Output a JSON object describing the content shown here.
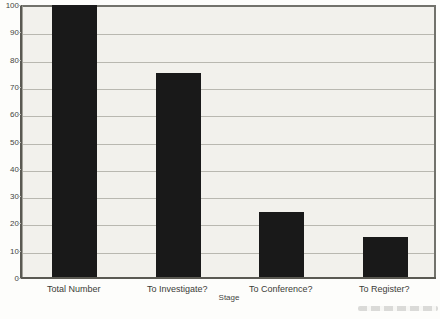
{
  "chart_data": {
    "type": "bar",
    "title": "",
    "xlabel": "Stage",
    "ylabel": "",
    "categories": [
      "Total Number",
      "To Investigate?",
      "To Conference?",
      "To Register?"
    ],
    "values": [
      100,
      75,
      24,
      15
    ],
    "ylim": [
      0,
      100
    ],
    "ytick_step": 10,
    "grid": true,
    "legend": "none",
    "colors": {
      "bar": "#191919",
      "plot_background": "#f2f1ec",
      "gridline": "#b9b8b0",
      "axis": "#5a5952",
      "frame": "#72726b",
      "text": "#3e3e3a",
      "page_background": "#fdfdfb"
    }
  }
}
